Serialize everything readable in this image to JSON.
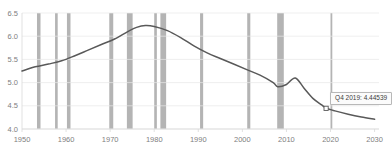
{
  "chart_data": {
    "type": "line",
    "title": "",
    "xlabel": "",
    "ylabel": "",
    "xlim": [
      1950,
      2031
    ],
    "ylim": [
      4.0,
      6.5
    ],
    "grid": true,
    "legend": "none",
    "x_ticks": [
      "1950",
      "1960",
      "1970",
      "1980",
      "1990",
      "2000",
      "2010",
      "2020",
      "2030"
    ],
    "x_tick_values": [
      1950,
      1960,
      1970,
      1980,
      1990,
      2000,
      2010,
      2020,
      2030
    ],
    "y_ticks": [
      "4.0",
      "4.5",
      "5.0",
      "5.5",
      "6.0",
      "6.5"
    ],
    "y_tick_values": [
      4.0,
      4.5,
      5.0,
      5.5,
      6.0,
      6.5
    ],
    "series": [
      {
        "name": "value",
        "color": "#595959",
        "x": [
          1950,
          1953,
          1956,
          1959,
          1962,
          1965,
          1968,
          1971,
          1974,
          1976,
          1978,
          1980,
          1983,
          1986,
          1989,
          1992,
          1995,
          1998,
          2001,
          2004,
          2007,
          2008,
          2010,
          2012,
          2014,
          2016,
          2018,
          2019,
          2021,
          2024,
          2027,
          2030
        ],
        "values": [
          5.25,
          5.34,
          5.4,
          5.47,
          5.58,
          5.7,
          5.82,
          5.94,
          6.1,
          6.19,
          6.23,
          6.21,
          6.12,
          5.97,
          5.79,
          5.64,
          5.52,
          5.4,
          5.28,
          5.16,
          5.0,
          4.91,
          4.96,
          5.1,
          4.88,
          4.66,
          4.52,
          4.45,
          4.39,
          4.32,
          4.26,
          4.21
        ]
      }
    ],
    "recession_bands": [
      {
        "start": 1953.4,
        "end": 1954.2
      },
      {
        "start": 1957.5,
        "end": 1958.1
      },
      {
        "start": 1960.2,
        "end": 1961.0
      },
      {
        "start": 1969.8,
        "end": 1970.7
      },
      {
        "start": 1973.8,
        "end": 1975.1
      },
      {
        "start": 1980.0,
        "end": 1980.6
      },
      {
        "start": 1981.4,
        "end": 1982.7
      },
      {
        "start": 1990.4,
        "end": 1991.1
      },
      {
        "start": 2001.1,
        "end": 2001.8
      },
      {
        "start": 2007.9,
        "end": 2009.4
      },
      {
        "start": 2020.0,
        "end": 2020.4
      }
    ],
    "highlight_point": {
      "x": 2019,
      "y": 4.44539,
      "label": "Q4 2019: 4.44539"
    },
    "colors": {
      "line": "#595959",
      "recession_band": "#b0b0b0",
      "gridline": "#e8e8e8",
      "axis_text": "#808080",
      "tooltip_border": "#b8b8b8",
      "tooltip_background": "#fbfbfb"
    }
  },
  "tooltip": {
    "text": "Q4 2019: 4.44539"
  }
}
